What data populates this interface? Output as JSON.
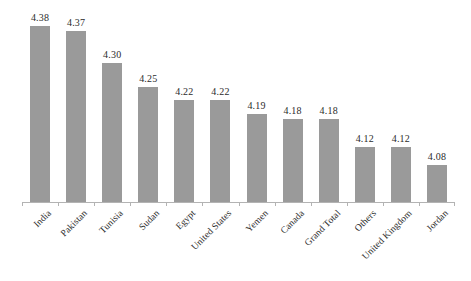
{
  "chart_data": {
    "type": "bar",
    "title": "",
    "subtitle": "",
    "xlabel": "",
    "ylabel": "",
    "categories": [
      "India",
      "Pakistan",
      "Tunisia",
      "Sudan",
      "Egypt",
      "United States",
      "Yemen",
      "Canada",
      "Grand Total",
      "Others",
      "United Kingdom",
      "Jordan"
    ],
    "values": [
      4.38,
      4.37,
      4.3,
      4.25,
      4.22,
      4.22,
      4.19,
      4.18,
      4.18,
      4.12,
      4.12,
      4.08
    ],
    "data_labels": [
      "4.38",
      "4.37",
      "4.30",
      "4.25",
      "4.22",
      "4.22",
      "4.19",
      "4.18",
      "4.18",
      "4.12",
      "4.12",
      "4.08"
    ],
    "ylim": [
      4.0,
      4.42
    ],
    "xtick_labels": [
      "India",
      "Pakistan",
      "Tunisia",
      "Sudan",
      "Egypt",
      "United States",
      "Yemen",
      "Canada",
      "Grand Total",
      "Others",
      "United Kingdom",
      "Jordan"
    ],
    "ytick_labels": [],
    "legend": [],
    "legend_position": "none",
    "grid": false,
    "y_axis_visible": false,
    "x_axis_visible": true,
    "bar_color": "#9a9a9a",
    "axis_color": "#b3b3b3",
    "label_color": "#2b2b2b",
    "background_color": "#ffffff",
    "xtick_label_rotation": -45
  }
}
